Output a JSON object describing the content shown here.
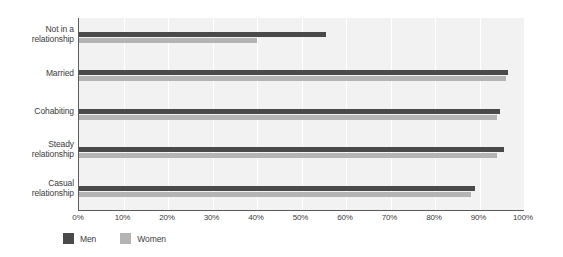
{
  "chart_data": {
    "type": "bar",
    "orientation": "horizontal",
    "title": "",
    "xlabel": "",
    "ylabel": "",
    "xlim": [
      0,
      100
    ],
    "xtick_labels": [
      "0%",
      "10%",
      "20%",
      "30%",
      "40%",
      "50%",
      "60%",
      "70%",
      "80%",
      "90%",
      "100%"
    ],
    "xticks": [
      0,
      10,
      20,
      30,
      40,
      50,
      60,
      70,
      80,
      90,
      100
    ],
    "grid": true,
    "grid_axis": "x",
    "legend_position": "bottom-left",
    "categories": [
      "Not in a relationship",
      "Married",
      "Cohabiting",
      "Steady relationship",
      "Casual relationship"
    ],
    "category_label_lines": [
      [
        "Not in a",
        "relationship"
      ],
      [
        "Married"
      ],
      [
        "Cohabiting"
      ],
      [
        "Steady",
        "relationship"
      ],
      [
        "Casual",
        "relationship"
      ]
    ],
    "series": [
      {
        "name": "Men",
        "color": "#4a4a4a",
        "values": [
          55.5,
          96.5,
          94.5,
          95.5,
          89
        ]
      },
      {
        "name": "Women",
        "color": "#b4b4b4",
        "values": [
          40,
          96,
          94,
          94,
          88
        ]
      }
    ]
  },
  "legend": {
    "items": [
      {
        "label": "Men",
        "color": "#4a4a4a"
      },
      {
        "label": "Women",
        "color": "#b4b4b4"
      }
    ]
  },
  "colors": {
    "plot_background": "#f2f2f2",
    "page_background": "#ffffff",
    "axis": "#5a5a5a",
    "gridline": "#ffffff",
    "text": "#3c3c3c",
    "men": "#4a4a4a",
    "women": "#b4b4b4"
  }
}
